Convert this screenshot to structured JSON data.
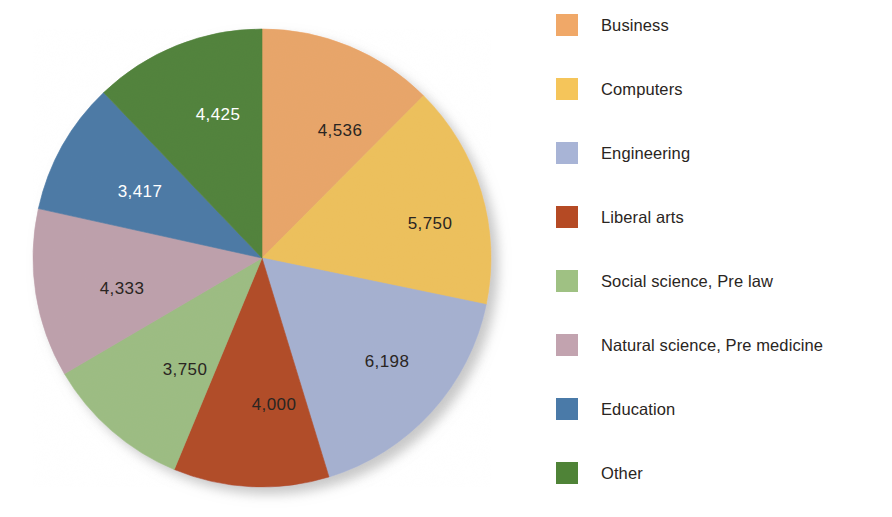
{
  "chart_data": {
    "type": "pie",
    "title": "",
    "subtitle": "",
    "xlabel": "",
    "ylabel": "",
    "grid": false,
    "legend_position": "right",
    "start_angle_deg": 0,
    "direction": "clockwise",
    "total": 36409,
    "categories": [
      "Business",
      "Computers",
      "Engineering",
      "Liberal arts",
      "Social science, Pre law",
      "Natural science, Pre medicine",
      "Education",
      "Other"
    ],
    "values": [
      4536,
      5750,
      6198,
      4000,
      3750,
      4333,
      3417,
      4425
    ],
    "value_labels": [
      "4,536",
      "5,750",
      "6,198",
      "4,000",
      "3,750",
      "4,333",
      "3,417",
      "4,425"
    ],
    "colors": [
      "#F0A868",
      "#F5C55A",
      "#A8B4D6",
      "#B54A24",
      "#9FC183",
      "#C2A3AF",
      "#4A7AA8",
      "#4F8337"
    ],
    "label_colors": [
      "dark",
      "dark",
      "dark",
      "dark",
      "dark",
      "dark",
      "light",
      "light"
    ],
    "slices": [
      {
        "name": "Business",
        "value": 4536,
        "label": "4,536",
        "color": "#F0A868",
        "label_color": "dark",
        "label_x": 318,
        "label_y": 123
      },
      {
        "name": "Computers",
        "value": 5750,
        "label": "5,750",
        "color": "#F5C55A",
        "label_color": "dark",
        "label_x": 408,
        "label_y": 216
      },
      {
        "name": "Engineering",
        "value": 6198,
        "label": "6,198",
        "color": "#A8B4D6",
        "label_color": "dark",
        "label_x": 365,
        "label_y": 354
      },
      {
        "name": "Liberal arts",
        "value": 4000,
        "label": "4,000",
        "color": "#B54A24",
        "label_color": "dark",
        "label_x": 252,
        "label_y": 397
      },
      {
        "name": "Social science, Pre law",
        "value": 3750,
        "label": "3,750",
        "color": "#9FC183",
        "label_color": "dark",
        "label_x": 163,
        "label_y": 362
      },
      {
        "name": "Natural science, Pre medicine",
        "value": 4333,
        "label": "4,333",
        "color": "#C2A3AF",
        "label_color": "dark",
        "label_x": 100,
        "label_y": 281
      },
      {
        "name": "Education",
        "value": 3417,
        "label": "3,417",
        "color": "#4A7AA8",
        "label_color": "light",
        "label_x": 118,
        "label_y": 184
      },
      {
        "name": "Other",
        "value": 4425,
        "label": "4,425",
        "color": "#4F8337",
        "label_color": "light",
        "label_x": 196,
        "label_y": 107
      }
    ]
  },
  "legend": {
    "items": [
      {
        "label": "Business",
        "color": "#F0A868"
      },
      {
        "label": "Computers",
        "color": "#F5C55A"
      },
      {
        "label": "Engineering",
        "color": "#A8B4D6"
      },
      {
        "label": "Liberal arts",
        "color": "#B54A24"
      },
      {
        "label": "Social science, Pre law",
        "color": "#9FC183"
      },
      {
        "label": "Natural science, Pre medicine",
        "color": "#C2A3AF"
      },
      {
        "label": "Education",
        "color": "#4A7AA8"
      },
      {
        "label": "Other",
        "color": "#4F8337"
      }
    ]
  },
  "geometry": {
    "center_x": 240,
    "center_y": 250,
    "radius": 229
  }
}
